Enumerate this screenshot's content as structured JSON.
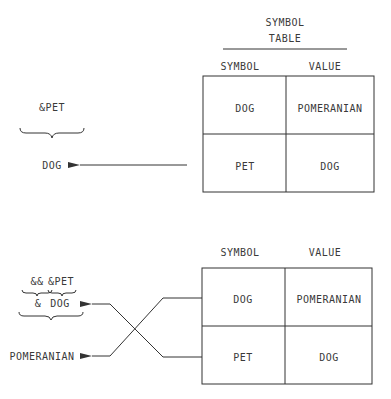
{
  "top_section": {
    "title_line1": "SYMBOL",
    "title_line2": "TABLE",
    "header_symbol": "SYMBOL",
    "header_value": "VALUE",
    "rows": [
      {
        "symbol": "DOG",
        "value": "POMERANIAN"
      },
      {
        "symbol": "PET",
        "value": "DOG"
      }
    ],
    "input_expression": "&PET",
    "result": "DOG"
  },
  "bottom_section": {
    "header_symbol": "SYMBOL",
    "header_value": "VALUE",
    "rows": [
      {
        "symbol": "DOG",
        "value": "POMERANIAN"
      },
      {
        "symbol": "PET",
        "value": "DOG"
      }
    ],
    "expr_part1": "&&",
    "expr_part2": "&PET",
    "intermediate_amp": "&",
    "intermediate_dog": "DOG",
    "result": "POMERANIAN"
  },
  "colors": {
    "line": "#333333",
    "text": "#3a3a3a",
    "background": "#ffffff"
  }
}
